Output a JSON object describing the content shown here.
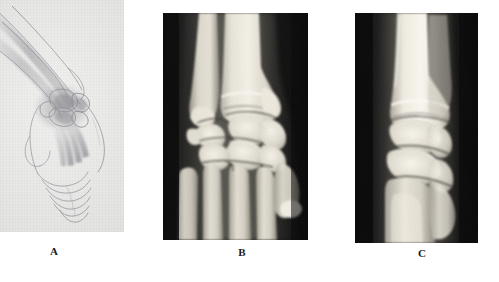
{
  "figure": {
    "caption_labels": [
      "A",
      "B",
      "C"
    ],
    "panel_count": 3,
    "background_color": "#ffffff"
  },
  "panels": [
    {
      "id": "A",
      "label": "A",
      "type": "line-art-illustration",
      "subject": "hand and wrist, ulnar/volar oblique view with carpal bones shaded",
      "background_color": "#e9e9e7",
      "ink_color": "#6e6e74",
      "shade_color": "#4a4a55",
      "x": 0,
      "y": 0,
      "width": 124,
      "height": 232
    },
    {
      "id": "B",
      "label": "B",
      "type": "radiograph",
      "view": "posteroanterior wrist",
      "background_color": "#0d0d0d",
      "bone_color": "#e9e6de",
      "soft_tissue_color": "#6a665f",
      "x": 163,
      "y": 13,
      "width": 145,
      "height": 227
    },
    {
      "id": "C",
      "label": "C",
      "type": "radiograph",
      "view": "lateral wrist",
      "background_color": "#101010",
      "bone_color": "#efece4",
      "soft_tissue_color": "#736f68",
      "x": 355,
      "y": 13,
      "width": 123,
      "height": 230
    }
  ],
  "labels": {
    "a": {
      "text": "A",
      "x": 54,
      "y": 246
    },
    "b": {
      "text": "B",
      "x": 232,
      "y": 247
    },
    "c": {
      "text": "C",
      "x": 412,
      "y": 248
    }
  }
}
